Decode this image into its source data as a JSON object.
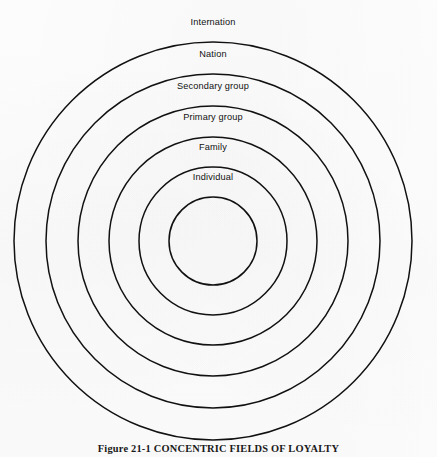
{
  "figure": {
    "caption_prefix": "Figure",
    "caption_number": "21-1",
    "caption_title": "CONCENTRIC FIELDS OF LOYALTY"
  },
  "diagram": {
    "type": "concentric-circles",
    "stroke_color": "#111111",
    "fill_color": "none",
    "background_color": "#fefefe",
    "center": {
      "x": 213,
      "y": 241
    },
    "rings": [
      {
        "label": "Internation",
        "radius": 199,
        "label_y": 17
      },
      {
        "label": "Nation",
        "radius": 167,
        "label_y": 49
      },
      {
        "label": "Secondary group",
        "radius": 135,
        "label_y": 81
      },
      {
        "label": "Primary group",
        "radius": 104,
        "label_y": 112
      },
      {
        "label": "Family",
        "radius": 74,
        "label_y": 142
      },
      {
        "label": "Individual",
        "radius": 44,
        "label_y": 172
      }
    ]
  }
}
